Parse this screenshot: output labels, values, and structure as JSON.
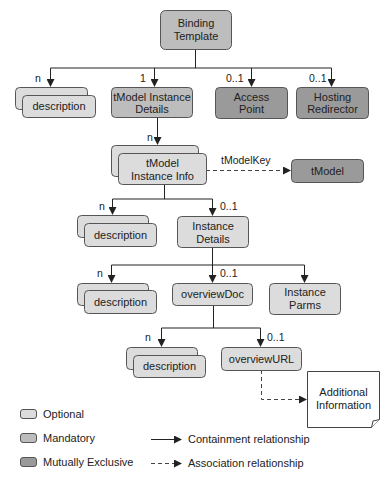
{
  "diagram": {
    "nodes": {
      "binding_template": {
        "line1": "Binding",
        "line2": "Template",
        "type": "mandatory"
      },
      "desc1": {
        "label": "description",
        "type": "optional",
        "multiple": true
      },
      "tmodel_instance_details": {
        "line1": "tModel Instance",
        "line2": "Details",
        "type": "mandatory"
      },
      "access_point": {
        "line1": "Access",
        "line2": "Point",
        "type": "mutually_exclusive"
      },
      "hosting_redirector": {
        "line1": "Hosting",
        "line2": "Redirector",
        "type": "mutually_exclusive"
      },
      "tmodel_instance_info": {
        "line1": "tModel",
        "line2": "Instance Info",
        "type": "optional",
        "multiple": true
      },
      "tmodel": {
        "label": "tModel",
        "type": "mutually_exclusive"
      },
      "desc2": {
        "label": "description",
        "type": "optional",
        "multiple": true
      },
      "instance_details": {
        "line1": "Instance",
        "line2": "Details",
        "type": "optional"
      },
      "desc3": {
        "label": "description",
        "type": "optional",
        "multiple": true
      },
      "overview_doc": {
        "label": "overviewDoc",
        "type": "optional"
      },
      "instance_parms": {
        "line1": "Instance",
        "line2": "Parms",
        "type": "optional"
      },
      "desc4": {
        "label": "description",
        "type": "optional",
        "multiple": true
      },
      "overview_url": {
        "label": "overviewURL",
        "type": "optional"
      },
      "additional_info": {
        "line1": "Additional",
        "line2": "Information",
        "type": "document"
      }
    },
    "cardinalities": {
      "desc1": "n",
      "tmodel_instance_details": "1",
      "access_point": "0..1",
      "hosting_redirector": "0..1",
      "tmodel_instance_info": "n",
      "desc2": "n",
      "instance_details": "0..1",
      "desc3": "n",
      "overview_doc": "0..1",
      "desc4": "n",
      "overview_url": "0..1"
    },
    "association_label": "tModelKey"
  },
  "legend": {
    "optional": "Optional",
    "mandatory": "Mandatory",
    "mutually_exclusive": "Mutually Exclusive",
    "containment": "Containment relationship",
    "association": "Association relationship"
  },
  "colors": {
    "optional": "#dcdcdc",
    "mandatory": "#bdbdbd",
    "mutually_exclusive": "#9a9a9a"
  }
}
